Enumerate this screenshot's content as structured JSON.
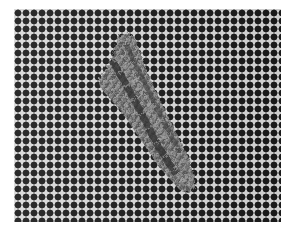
{
  "image": {
    "subject": "needlepoint stitches on canvas mesh",
    "description": "Grayscale photo of an open square-weave needlepoint canvas with a diagonal band of wool stitches running from upper-center to lower-right",
    "background_color": "#ffffff",
    "mesh": {
      "thread_color": "#d8d8d8",
      "hole_color": "#1a1a1a",
      "pitch_px": 8,
      "bounds": {
        "left": 14,
        "top": 9,
        "right": 281,
        "bottom": 222
      }
    },
    "stitch_band": {
      "color_light": "#8a8a8a",
      "color_dark": "#3a3a3a",
      "direction": "diagonal top-left to bottom-right",
      "start": {
        "x": 122,
        "y": 36
      },
      "end": {
        "x": 186,
        "y": 190
      }
    }
  }
}
